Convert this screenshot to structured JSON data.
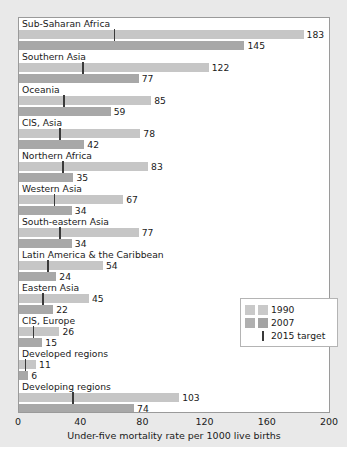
{
  "chart_data": {
    "type": "bar",
    "title": "",
    "subtitle": "",
    "xlabel": "Under-five mortality rate per 1000 live births",
    "ylabel": "",
    "orientation": "horizontal",
    "xlim": [
      0,
      200
    ],
    "xticks": [
      0,
      40,
      80,
      120,
      160,
      200
    ],
    "grid": false,
    "legend_position": "bottom-right",
    "categories": [
      "Sub-Saharan Africa",
      "Southern Asia",
      "Oceania",
      "CIS, Asia",
      "Northern Africa",
      "Western Asia",
      "South-eastern Asia",
      "Latin America & the Caribbean",
      "Eastern Asia",
      "CIS, Europe",
      "Developed regions",
      "Developing regions"
    ],
    "series": [
      {
        "name": "1990",
        "color": "#c6c6c6",
        "values": [
          183,
          122,
          85,
          78,
          83,
          67,
          77,
          54,
          45,
          26,
          11,
          103
        ]
      },
      {
        "name": "2007",
        "color": "#a8a8a8",
        "values": [
          145,
          77,
          59,
          42,
          35,
          34,
          34,
          24,
          22,
          15,
          6,
          74
        ]
      }
    ],
    "markers": {
      "name": "2015 target",
      "color": "#3a3a3a",
      "values": [
        61,
        40.7,
        28.3,
        26,
        27.7,
        22.3,
        25.7,
        18,
        15,
        8.7,
        3.7,
        34.3
      ]
    }
  },
  "legend": {
    "entries": [
      {
        "label": "1990"
      },
      {
        "label": "2007"
      },
      {
        "label": "2015 target"
      }
    ]
  },
  "axis": {
    "tick_labels": [
      "0",
      "40",
      "80",
      "120",
      "160",
      "200"
    ],
    "caption": "Under-five mortality rate per 1000 live births"
  }
}
